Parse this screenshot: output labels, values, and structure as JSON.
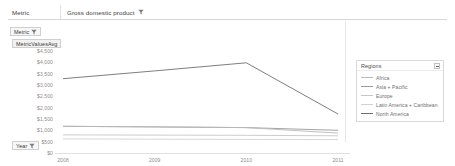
{
  "filter_bar": {
    "label": "Metric",
    "value": "Gross domestic product",
    "icon": "filter-sort-icon"
  },
  "shelves": [
    {
      "label": "Metric",
      "icon": "filter-sort-icon",
      "name": "pill-metric"
    },
    {
      "label": "MetricValuesAvg",
      "icon": "",
      "name": "pill-measure"
    },
    {
      "label": "Year",
      "icon": "filter-sort-icon",
      "name": "pill-year"
    }
  ],
  "legend": {
    "title": "Regions",
    "menu_icon": "minimize-icon",
    "entries": [
      {
        "label": "Africa",
        "color": "#b9b9b9"
      },
      {
        "label": "Asia + Pacific",
        "color": "#9a9a9a"
      },
      {
        "label": "Europe",
        "color": "#c6c6c6"
      },
      {
        "label": "Latin America + Caribbean",
        "color": "#d2d2d2"
      },
      {
        "label": "North America",
        "color": "#6f6f6f"
      }
    ]
  },
  "chart_data": {
    "type": "line",
    "title": "",
    "xlabel": "",
    "ylabel": "MetricValuesAvg",
    "x": [
      "2008",
      "2009",
      "2010",
      "2011"
    ],
    "ylim": [
      0,
      4500
    ],
    "yticks": [
      "$4,500",
      "$4,000",
      "$3,500",
      "$3,000",
      "$2,500",
      "$2,000",
      "$1,500",
      "$1,000",
      "$500",
      "$0"
    ],
    "grid": false,
    "legend_position": "right",
    "series": [
      {
        "name": "North America",
        "color": "#6f6f6f",
        "values": [
          3280,
          3620,
          3980,
          1720
        ]
      },
      {
        "name": "Asia + Pacific",
        "color": "#9a9a9a",
        "values": [
          1180,
          1150,
          1120,
          1000
        ]
      },
      {
        "name": "Africa",
        "color": "#b9b9b9",
        "values": [
          1180,
          1150,
          1120,
          880
        ]
      },
      {
        "name": "Europe",
        "color": "#c6c6c6",
        "values": [
          800,
          790,
          780,
          760
        ]
      },
      {
        "name": "Latin America + Caribbean",
        "color": "#d2d2d2",
        "values": [
          620,
          610,
          600,
          590
        ]
      }
    ]
  }
}
